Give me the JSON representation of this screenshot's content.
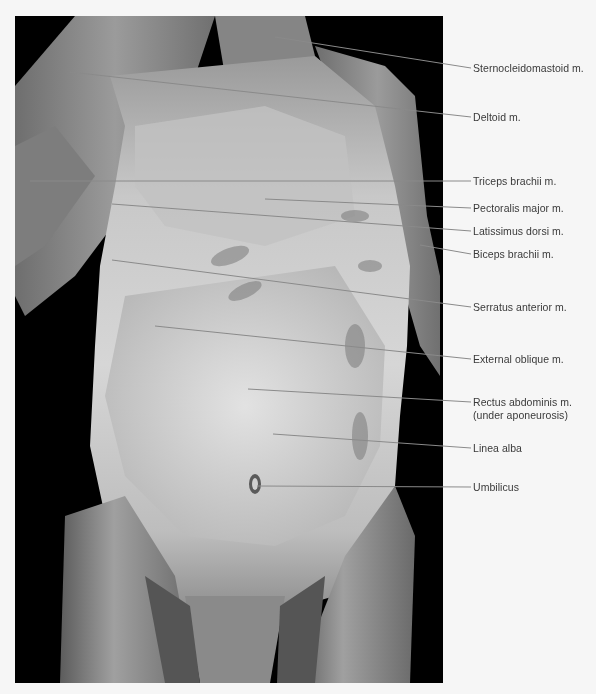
{
  "figure": {
    "type": "anatomical dissection photograph",
    "view": "anterior trunk, superficial muscles",
    "photo_tone": "grayscale",
    "colors": {
      "page_background": "#f6f6f6",
      "photo_background": "#000000",
      "leader_line": "#8a8a8a",
      "label_text": "#3a3a3a"
    }
  },
  "labels": [
    {
      "id": "sternocleidomastoid",
      "text": "Sternocleidomastoid m.",
      "y": 62,
      "line": {
        "x1": 275,
        "y1": 37,
        "x2": 471,
        "y2": 68
      }
    },
    {
      "id": "deltoid",
      "text": "Deltoid m.",
      "y": 111,
      "line": {
        "x1": 70,
        "y1": 72,
        "x2": 471,
        "y2": 117
      }
    },
    {
      "id": "triceps-brachii",
      "text": "Triceps brachii m.",
      "y": 175,
      "line": {
        "x1": 30,
        "y1": 181,
        "x2": 471,
        "y2": 181
      }
    },
    {
      "id": "pectoralis-major",
      "text": "Pectoralis major m.",
      "y": 202,
      "line": {
        "x1": 265,
        "y1": 199,
        "x2": 471,
        "y2": 208
      }
    },
    {
      "id": "latissimus-dorsi",
      "text": "Latissimus dorsi m.",
      "y": 225,
      "line": {
        "x1": 112,
        "y1": 204,
        "x2": 471,
        "y2": 231
      }
    },
    {
      "id": "biceps-brachii",
      "text": "Biceps brachii m.",
      "y": 248,
      "line": {
        "x1": 420,
        "y1": 245,
        "x2": 471,
        "y2": 254
      }
    },
    {
      "id": "serratus-anterior",
      "text": "Serratus anterior m.",
      "y": 301,
      "line": {
        "x1": 112,
        "y1": 260,
        "x2": 471,
        "y2": 307
      }
    },
    {
      "id": "external-oblique",
      "text": "External oblique m.",
      "y": 353,
      "line": {
        "x1": 155,
        "y1": 326,
        "x2": 471,
        "y2": 359
      }
    },
    {
      "id": "rectus-abdominis",
      "text": "Rectus abdominis m.",
      "text2": "(under aponeurosis)",
      "y": 396,
      "line": {
        "x1": 248,
        "y1": 389,
        "x2": 471,
        "y2": 402
      }
    },
    {
      "id": "linea-alba",
      "text": "Linea alba",
      "y": 442,
      "line": {
        "x1": 273,
        "y1": 434,
        "x2": 471,
        "y2": 448
      }
    },
    {
      "id": "umbilicus",
      "text": "Umbilicus",
      "y": 481,
      "line": {
        "x1": 257,
        "y1": 486,
        "x2": 471,
        "y2": 487
      }
    }
  ]
}
